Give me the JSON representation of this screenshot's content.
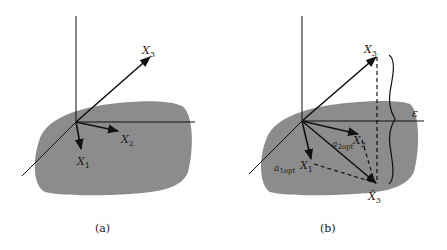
{
  "figure": {
    "panels": [
      {
        "id": "a",
        "caption": "(a)",
        "labels": {
          "x1": "X",
          "x1_sub": "1",
          "x2": "X",
          "x2_sub": "2",
          "x3": "X",
          "x3_sub": "3"
        }
      },
      {
        "id": "b",
        "caption": "(b)",
        "labels": {
          "x1": "X",
          "x1_sub": "1",
          "x2": "X",
          "x2_sub": "2",
          "x3": "X",
          "x3_sub": "3",
          "x3hat": "X̂",
          "x3hat_sub": "3",
          "a1": "a",
          "a1_sub": "1opt",
          "a2": "a",
          "a2_sub": "2opt",
          "epsilon": "ε"
        }
      }
    ],
    "colors": {
      "plane": "#8c8c8c",
      "line": "#111111",
      "background": "#ffffff"
    }
  }
}
